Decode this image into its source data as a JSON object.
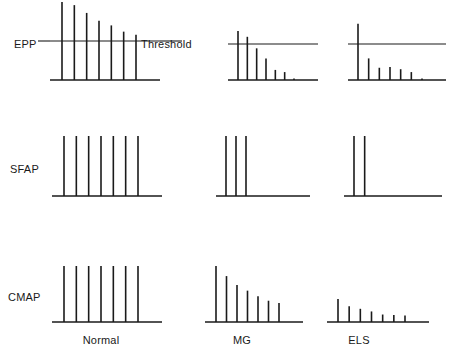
{
  "figure": {
    "row_labels": [
      "EPP",
      "SFAP",
      "CMAP"
    ],
    "column_labels": [
      "Normal",
      "MG",
      "ELS"
    ],
    "threshold_label": "Threshold"
  },
  "chart_data": {
    "type": "bar",
    "title": "",
    "xlabel": "",
    "ylabel": "",
    "grid": false,
    "legend": null,
    "rows": [
      {
        "name": "EPP",
        "has_threshold": true,
        "threshold_value": 50,
        "ylim": [
          0,
          100
        ],
        "panels": [
          {
            "condition": "Normal",
            "x": [
              1,
              2,
              3,
              4,
              5,
              6,
              7
            ],
            "values": [
              100,
              96,
              86,
              76,
              70,
              62,
              58
            ],
            "note": "all responses remain above threshold"
          },
          {
            "condition": "MG",
            "x": [
              1,
              2,
              3,
              4,
              5,
              6,
              7
            ],
            "values": [
              68,
              60,
              44,
              30,
              14,
              11,
              2
            ],
            "note": "rapid decrement, responses fall below threshold"
          },
          {
            "condition": "ELS",
            "x": [
              1,
              2,
              3,
              4,
              5,
              6,
              7
            ],
            "values": [
              78,
              30,
              17,
              18,
              15,
              11,
              2
            ],
            "note": "low first response, most responses below threshold"
          }
        ]
      },
      {
        "name": "SFAP",
        "has_threshold": false,
        "ylim": [
          0,
          100
        ],
        "panels": [
          {
            "condition": "Normal",
            "x": [
              1,
              2,
              3,
              4,
              5,
              6,
              7
            ],
            "values": [
              100,
              100,
              100,
              100,
              100,
              100,
              100
            ],
            "note": "all seven impulses propagate"
          },
          {
            "condition": "MG",
            "x": [
              1,
              2,
              3,
              4,
              5,
              6,
              7
            ],
            "values": [
              100,
              100,
              100,
              0,
              0,
              0,
              0
            ],
            "note": "transmission blocks after third impulse"
          },
          {
            "condition": "ELS",
            "x": [
              1,
              2,
              3,
              4,
              5,
              6,
              7
            ],
            "values": [
              100,
              100,
              0,
              0,
              0,
              0,
              0
            ],
            "note": "transmission blocks after second impulse"
          }
        ]
      },
      {
        "name": "CMAP",
        "has_threshold": false,
        "ylim": [
          0,
          100
        ],
        "panels": [
          {
            "condition": "Normal",
            "x": [
              1,
              2,
              3,
              4,
              5,
              6,
              7
            ],
            "values": [
              100,
              100,
              100,
              100,
              100,
              100,
              100
            ],
            "note": "no decrement"
          },
          {
            "condition": "MG",
            "x": [
              1,
              2,
              3,
              4,
              5,
              6,
              7
            ],
            "values": [
              100,
              82,
              66,
              56,
              46,
              38,
              34
            ],
            "note": "progressive decrement"
          },
          {
            "condition": "ELS",
            "x": [
              1,
              2,
              3,
              4,
              5,
              6,
              7
            ],
            "values": [
              52,
              36,
              30,
              24,
              17,
              16,
              15
            ],
            "note": "low amplitude baseline with slight decrement"
          }
        ]
      }
    ]
  },
  "colors": {
    "ink": "#1a1a1a",
    "background": "#ffffff"
  }
}
